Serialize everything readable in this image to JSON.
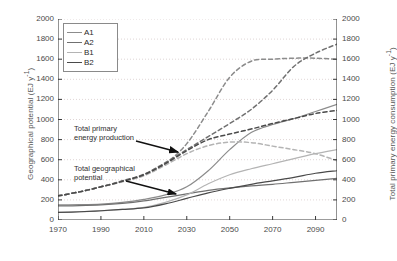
{
  "chart_data": {
    "type": "line",
    "title": "",
    "xlabel": "",
    "ylabel": "Geographical potential  (EJ y",
    "ylabel_sup": "-1",
    "ylabel_tail": ")",
    "y2label": "Total primary energy consumption (EJ y",
    "y2label_sup": "-1",
    "y2label_tail": ")",
    "xlim": [
      1970,
      2100
    ],
    "ylim": [
      0,
      2000
    ],
    "y2lim": [
      0,
      2000
    ],
    "grid": true,
    "legend_position": "top-left",
    "x_ticks": [
      1970,
      1990,
      2010,
      2030,
      2050,
      2070,
      2090
    ],
    "y_ticks": [
      0,
      200,
      400,
      600,
      800,
      1000,
      1200,
      1400,
      1600,
      1800,
      2000
    ],
    "y2_ticks": [
      0,
      200,
      400,
      600,
      800,
      1000,
      1200,
      1400,
      1600,
      1800,
      2000
    ],
    "legend": [
      {
        "name": "A1",
        "color": "#8c8c8c"
      },
      {
        "name": "A2",
        "color": "#707070"
      },
      {
        "name": "B1",
        "color": "#b4b4b4"
      },
      {
        "name": "B2",
        "color": "#4a4a4a"
      }
    ],
    "annotations": [
      {
        "id": "production",
        "text": "Total primary\nenergy production"
      },
      {
        "id": "potential",
        "text": "Total geographical\npotential"
      }
    ],
    "x": [
      1970,
      1980,
      1990,
      2000,
      2010,
      2020,
      2030,
      2040,
      2050,
      2060,
      2070,
      2080,
      2090,
      2100
    ],
    "series": [
      {
        "name": "A1 geographical potential",
        "group": "Total geographical potential",
        "style": "solid",
        "color": "#8c8c8c",
        "values": [
          150,
          152,
          158,
          175,
          205,
          250,
          330,
          490,
          700,
          870,
          950,
          1010,
          1080,
          1150
        ]
      },
      {
        "name": "A2 geographical potential",
        "group": "Total geographical potential",
        "style": "solid",
        "color": "#707070",
        "values": [
          140,
          143,
          150,
          165,
          190,
          225,
          260,
          295,
          320,
          340,
          355,
          375,
          395,
          415
        ]
      },
      {
        "name": "B1 geographical potential",
        "group": "Total geographical potential",
        "style": "solid",
        "color": "#b4b4b4",
        "values": [
          75,
          80,
          90,
          105,
          125,
          175,
          250,
          360,
          450,
          510,
          560,
          610,
          660,
          700
        ]
      },
      {
        "name": "B2 geographical potential",
        "group": "Total geographical potential",
        "style": "solid",
        "color": "#4a4a4a",
        "values": [
          75,
          82,
          92,
          105,
          120,
          160,
          215,
          270,
          315,
          355,
          390,
          425,
          465,
          490
        ]
      },
      {
        "name": "A1 primary energy production",
        "group": "Total primary energy production",
        "style": "dashed",
        "color": "#8c8c8c",
        "values": [
          240,
          280,
          330,
          385,
          445,
          560,
          760,
          1080,
          1420,
          1580,
          1600,
          1610,
          1610,
          1600
        ]
      },
      {
        "name": "A2 primary energy production",
        "group": "Total primary energy production",
        "style": "dashed",
        "color": "#707070",
        "values": [
          240,
          280,
          330,
          390,
          455,
          570,
          700,
          830,
          960,
          1100,
          1290,
          1530,
          1660,
          1750
        ]
      },
      {
        "name": "B1 primary energy production",
        "group": "Total primary energy production",
        "style": "dashed",
        "color": "#b4b4b4",
        "values": [
          240,
          280,
          330,
          380,
          440,
          545,
          660,
          740,
          775,
          770,
          735,
          700,
          660,
          590
        ]
      },
      {
        "name": "B2 primary energy production",
        "group": "Total primary energy production",
        "style": "dashed",
        "color": "#4a4a4a",
        "values": [
          240,
          280,
          330,
          385,
          450,
          560,
          690,
          800,
          855,
          905,
          960,
          1010,
          1060,
          1090
        ]
      }
    ]
  },
  "top_caption": ""
}
